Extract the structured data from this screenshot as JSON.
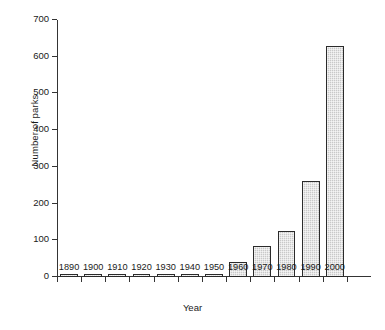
{
  "chart_data": {
    "type": "bar",
    "title": "",
    "xlabel": "Year",
    "ylabel": "Number of parks",
    "categories": [
      "1890",
      "1900",
      "1910",
      "1920",
      "1930",
      "1940",
      "1950",
      "1960",
      "1970",
      "1980",
      "1990",
      "2000"
    ],
    "values": [
      0,
      1,
      1,
      2,
      3,
      4,
      6,
      38,
      80,
      121,
      259,
      626
    ],
    "ylim": [
      0,
      700
    ],
    "yticks": [
      0,
      100,
      200,
      300,
      400,
      500,
      600,
      700
    ],
    "ytick_labels": [
      "0",
      "100",
      "200",
      "300",
      "400",
      "500",
      "600",
      "700"
    ],
    "grid": false,
    "legend": false,
    "bar_fill_color": "#c9c9c9",
    "bar_edge_color": "#2b2b2b",
    "axis_color": "#343434",
    "background_color": "#ffffff"
  }
}
